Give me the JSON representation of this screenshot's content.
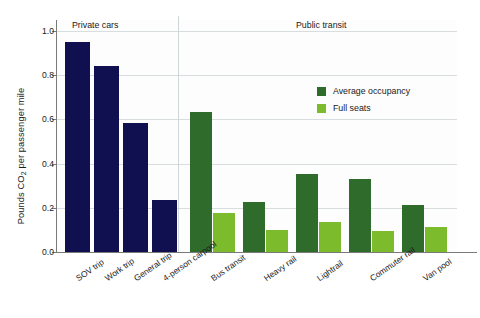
{
  "chart_data": {
    "type": "bar",
    "title": "",
    "xlabel": "",
    "ylabel": "Pounds CO2 per passenger mile",
    "ylabel_prefix": "Pounds CO",
    "ylabel_sub": "2",
    "ylabel_suffix": " per passenger mile",
    "ylim": [
      0.0,
      1.05
    ],
    "yticks": [
      0.0,
      0.2,
      0.4,
      0.6,
      0.8,
      1.0
    ],
    "ytick_labels": [
      "0.0",
      "0.2",
      "0.4",
      "0.6",
      "0.8",
      "1.0"
    ],
    "grid": "horizontal",
    "legend_position": "upper-right-inside",
    "categories": [
      "SOV trip",
      "Work trip",
      "General trip",
      "4-person carpool",
      "Bus transit",
      "Heavy rail",
      "Lightrail",
      "Commuter rail",
      "Van pool"
    ],
    "series": [
      {
        "name": "Average occupancy",
        "color": "#2f6c2c",
        "values": [
          0.95,
          0.84,
          0.585,
          0.235,
          0.635,
          0.225,
          0.355,
          0.33,
          0.215
        ]
      },
      {
        "name": "Full seats",
        "color": "#7cbb2c",
        "values": [
          null,
          null,
          null,
          null,
          0.175,
          0.1,
          0.135,
          0.093,
          0.113
        ]
      }
    ],
    "private_car_color": "#101050",
    "groups": [
      {
        "label": "Private cars",
        "categories": [
          "SOV trip",
          "Work trip",
          "General trip",
          "4-person carpool"
        ]
      },
      {
        "label": "Public transit",
        "categories": [
          "Bus transit",
          "Heavy rail",
          "Lightrail",
          "Commuter rail",
          "Van pool"
        ]
      }
    ],
    "annotations": []
  },
  "legend": {
    "items": [
      {
        "label": "Average occupancy",
        "color": "#2f6c2c"
      },
      {
        "label": "Full seats",
        "color": "#7cbb2c"
      }
    ]
  },
  "sections": {
    "private": "Private cars",
    "public": "Public transit"
  }
}
